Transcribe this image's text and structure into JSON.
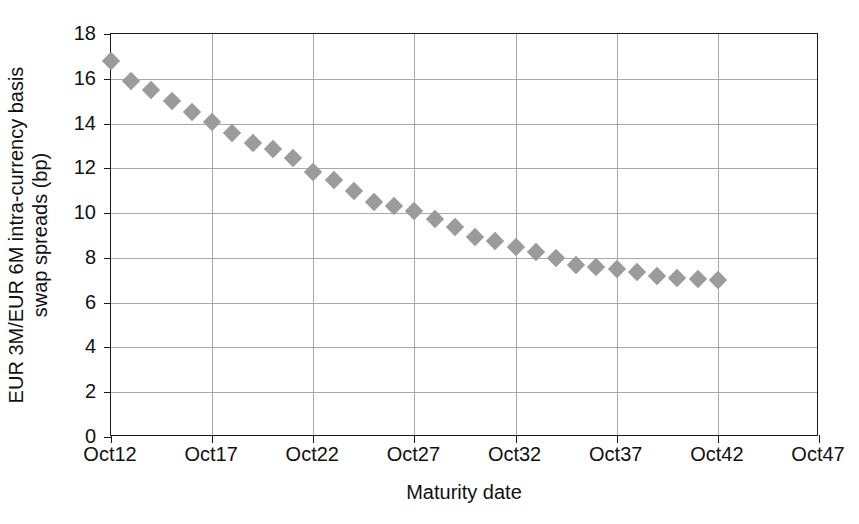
{
  "chart_data": {
    "type": "scatter",
    "title": "",
    "xlabel": "Maturity date",
    "ylabel": "EUR 3M/EUR 6M intra-currency basis swap spreads (bp)",
    "ylabel_lines": [
      "EUR 3M/EUR 6M intra-currency basis",
      "swap spreads (bp)"
    ],
    "marker": "diamond",
    "marker_color": "#9b9b9b",
    "grid": true,
    "legend": "none",
    "ylim": [
      0,
      18
    ],
    "ytick_labels": [
      "0",
      "2",
      "4",
      "6",
      "8",
      "10",
      "12",
      "14",
      "16",
      "18"
    ],
    "ytick_values": [
      0,
      2,
      4,
      6,
      8,
      10,
      12,
      14,
      16,
      18
    ],
    "xlim": [
      2012,
      2047
    ],
    "xtick_labels": [
      "Oct12",
      "Oct17",
      "Oct22",
      "Oct27",
      "Oct32",
      "Oct37",
      "Oct42",
      "Oct47"
    ],
    "xtick_values": [
      2012,
      2017,
      2022,
      2027,
      2032,
      2037,
      2042,
      2047
    ],
    "categories": [
      "Oct12",
      "Oct13",
      "Oct14",
      "Oct15",
      "Oct16",
      "Oct17",
      "Oct18",
      "Oct19",
      "Oct20",
      "Oct21",
      "Oct22",
      "Oct23",
      "Oct24",
      "Oct25",
      "Oct26",
      "Oct27",
      "Oct28",
      "Oct29",
      "Oct30",
      "Oct31",
      "Oct32",
      "Oct33",
      "Oct34",
      "Oct35",
      "Oct36",
      "Oct37",
      "Oct38",
      "Oct39",
      "Oct40",
      "Oct41",
      "Oct42"
    ],
    "x": [
      2012,
      2013,
      2014,
      2015,
      2016,
      2017,
      2018,
      2019,
      2020,
      2021,
      2022,
      2023,
      2024,
      2025,
      2026,
      2027,
      2028,
      2029,
      2030,
      2031,
      2032,
      2033,
      2034,
      2035,
      2036,
      2037,
      2038,
      2039,
      2040,
      2041,
      2042
    ],
    "values": [
      16.8,
      15.9,
      15.5,
      15.0,
      14.5,
      14.05,
      13.6,
      13.15,
      12.85,
      12.45,
      11.85,
      11.5,
      11.0,
      10.5,
      10.3,
      10.1,
      9.75,
      9.4,
      8.95,
      8.75,
      8.5,
      8.25,
      8.0,
      7.7,
      7.6,
      7.5,
      7.35,
      7.2,
      7.1,
      7.05,
      7.0
    ]
  },
  "colors": {
    "marker": "#9b9b9b",
    "axis": "#1a1a1a",
    "grid": "#a8a8a8",
    "text": "#111111",
    "background": "#ffffff"
  }
}
